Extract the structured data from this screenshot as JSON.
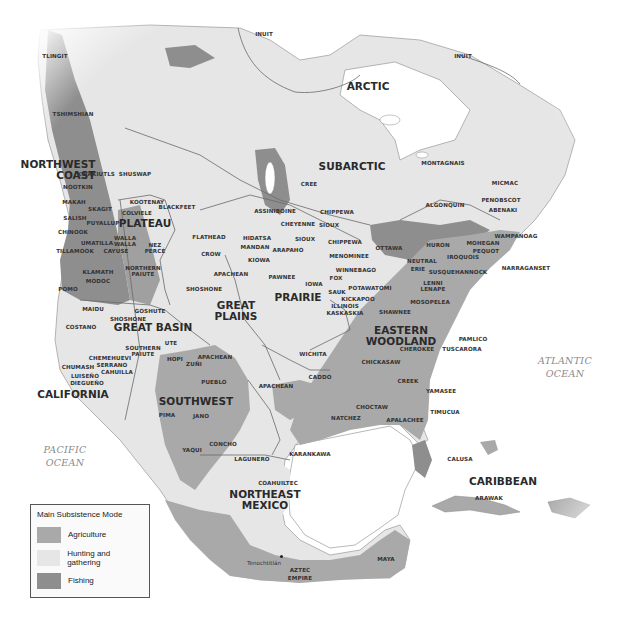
{
  "map": {
    "colors": {
      "agriculture": "#a9a9a9",
      "hunting_gathering": "#e6e6e6",
      "fishing": "#8e8e8e",
      "water": "#ffffff",
      "boundary": "#6a6a6a"
    },
    "regions": {
      "arctic": "ARCTIC",
      "subarctic": "SUBARCTIC",
      "northwest_coast": "NORTHWEST\nCOAST",
      "plateau": "PLATEAU",
      "great_basin": "GREAT BASIN",
      "california": "CALIFORNIA",
      "great_plains": "GREAT\nPLAINS",
      "prairie": "PRAIRIE",
      "eastern_woodland": "EASTERN\nWOODLAND",
      "southwest": "SOUTHWEST",
      "northeast_mexico": "NORTHEAST\nMEXICO",
      "caribbean": "CARIBBEAN"
    },
    "oceans": {
      "pacific": "PACIFIC\nOCEAN",
      "atlantic": "ATLANTIC\nOCEAN"
    },
    "peoples": {
      "inuit_west": "INUIT",
      "inuit_east": "INUIT",
      "tlingit": "TLINGIT",
      "tsimshian": "TSHIMSHIAN",
      "kwakiutls": "KWAKIUTLS",
      "nootkin": "NOOTKIN",
      "shuswap": "SHUSWAP",
      "makah": "MAKAH",
      "skagit": "SKAGIT",
      "kootenay": "KOOTENAY",
      "blackfeet": "BLACKFEET",
      "salish": "SALISH",
      "colville": "COLVIELE",
      "puyallup": "PUYALLUP",
      "chinook": "CHINOOK",
      "walla_walla": "WALLA\nWALLA",
      "umatilla": "UMATILLA",
      "tillamook": "TILLAMOOK",
      "cayuse": "CAYUSE",
      "nez_perce": "NEZ\nPERCÉ",
      "flathead": "FLATHEAD",
      "crow": "CROW",
      "klamath": "KLAMATH",
      "modoc": "MODOC",
      "northern_paiute": "NORTHERN\nPAIUTE",
      "pomo": "POMO",
      "shoshone_plains": "SHOSHONE",
      "maidu": "MAIDU",
      "goshute": "GOSHUTE",
      "shoshone_basin": "SHOSHONE",
      "costano": "COSTANO",
      "southern_paiute": "SOUTHERN\nPAIUTE",
      "ute": "UTE",
      "chemehuevi": "CHEMEHUEVI",
      "serrano": "SERRANO",
      "chumash": "CHUMASH",
      "cahuilla": "CAHUILLA",
      "luiseno": "LUISEÑO",
      "diegueno": "DIEGUEÑO",
      "hopi": "HOPI",
      "zuni": "ZUÑI",
      "apachean_sw": "APACHEAN",
      "pueblo": "PUEBLO",
      "pima": "PIMA",
      "jano": "JANO",
      "yaqui": "YAQUI",
      "concho": "CONCHO",
      "lagunero": "LAGUNERO",
      "coahuiltec": "COAHUILTEC",
      "karankawa": "KARANKAWA",
      "cree": "CREE",
      "assiniboine": "ASSINIBOINE",
      "cheyenne": "CHEYENNE",
      "chippewa_n": "CHIPPEWA",
      "sioux_n": "SIOUX",
      "hidatsa": "HIDATSA",
      "mandan": "MANDAN",
      "sioux_s": "SIOUX",
      "arapaho": "ARAPAHO",
      "kiowa": "KIOWA",
      "apachean_plains": "APACHEAN",
      "pawnee": "PAWNEE",
      "iowa": "IOWA",
      "chippewa_s": "CHIPPEWA",
      "menominee": "MENOMINEE",
      "ottawa": "OTTAWA",
      "winnebago": "WINNEBAGO",
      "fox": "FOX",
      "potawatomi": "POTAWATOMI",
      "sauk": "SAUK",
      "kickapoo": "KICKAPOO",
      "illinois": "ILLINOIS",
      "kaskaskia": "KASKASKIA",
      "wichita": "WICHITA",
      "caddo": "CADDO",
      "apachean_s": "APACHEAN",
      "montagnais": "MONTAGNAIS",
      "micmac": "MICMAC",
      "algonquin": "ALGONQUIN",
      "penobscot": "PENOBSCOT",
      "abenaki": "ABENAKI",
      "wampanoag": "WAMPANOAG",
      "huron": "HURON",
      "mohegan": "MOHEGAN",
      "pequot": "PEQUOT",
      "iroquois": "IROQUOIS",
      "neutral": "NEUTRAL",
      "erie": "ERIE",
      "susquehannock": "SUSQUEHANNOCK",
      "narraganset": "NARRAGANSET",
      "lenni_lenape": "LENNI\nLENAPE",
      "mosopelea": "MOSOPELEA",
      "shawnee": "SHAWNEE",
      "pamlico": "PAMLICO",
      "cherokee": "CHEROKEE",
      "tuscarora": "TUSCARORA",
      "chickasaw": "CHICKASAW",
      "creek": "CREEK",
      "yamasee": "YAMASEE",
      "choctaw": "CHOCTAW",
      "timucua": "TIMUCUA",
      "natchez": "NATCHEZ",
      "apalachee": "APALACHEE",
      "calusa": "CALUSA",
      "arawak": "ARAWAK",
      "maya": "MAYA",
      "aztec": "AZTEC\nEMPIRE"
    },
    "cities": {
      "tenochtitlan": "Tenochtitlán"
    }
  },
  "legend": {
    "title": "Main Subsistence Mode",
    "items": [
      {
        "label": "Agriculture",
        "color": "#a9a9a9"
      },
      {
        "label": "Hunting and gathering",
        "color": "#e6e6e6"
      },
      {
        "label": "Fishing",
        "color": "#8e8e8e"
      }
    ]
  }
}
